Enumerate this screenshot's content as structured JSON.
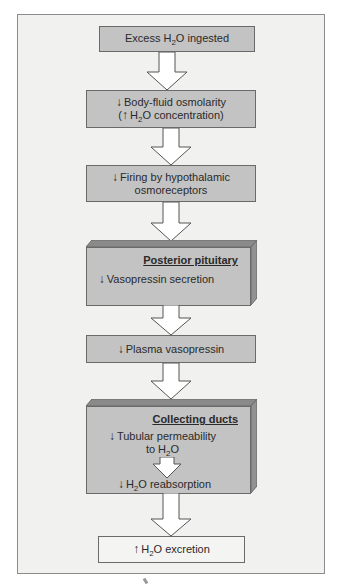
{
  "diagram": {
    "type": "flowchart",
    "direction": "top-to-bottom",
    "colors": {
      "frame_background": "#f1f1f0",
      "box_fill": "#c3c3c3",
      "box_border": "#6a6a6a",
      "box_top_face": "#8a8a8a",
      "box_side_face": "#929292",
      "final_box_fill": "#f4f4f2",
      "text": "#2a2a2a"
    },
    "symbols": {
      "down": "↓",
      "up": "↑"
    },
    "steps": [
      {
        "id": "step1",
        "arrow": "",
        "text": "Excess H",
        "sub": "2",
        "text_after": "O ingested"
      },
      {
        "id": "step2",
        "arrow": "↓",
        "line1": "Body-fluid osmolarity",
        "line2_open": "(",
        "line2_arrow": "↑",
        "line2_text": "H",
        "line2_sub": "2",
        "line2_after": "O concentration)"
      },
      {
        "id": "step3",
        "arrow": "↓",
        "line1": "Firing by hypothalamic",
        "line2": "osmoreceptors"
      },
      {
        "id": "step4",
        "heading": "Posterior pituitary",
        "arrow": "↓",
        "line1": "Vasopressin secretion"
      },
      {
        "id": "step5",
        "arrow": "↓",
        "line1": "Plasma vasopressin"
      },
      {
        "id": "step6",
        "heading": "Collecting ducts",
        "arrow": "↓",
        "line1": "Tubular permeability",
        "line2": "to H",
        "line2_sub": "2",
        "line2_after": "O",
        "inner_arrow": "↓",
        "inner_text": "H",
        "inner_sub": "2",
        "inner_after": "O reabsorption"
      },
      {
        "id": "step7",
        "arrow": "↑",
        "text": "H",
        "sub": "2",
        "text_after": "O excretion"
      }
    ]
  }
}
